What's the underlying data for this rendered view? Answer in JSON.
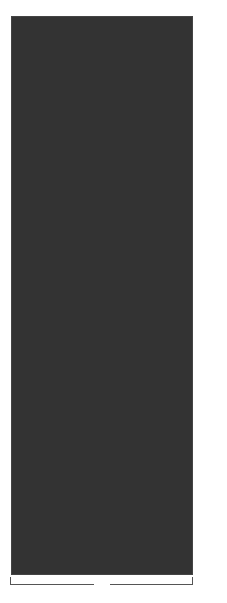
{
  "chart_data": {
    "type": "heatmap",
    "xlabel": "20-st rep",
    "ylabel": "",
    "columns": 20,
    "rows": 60,
    "row_labels": [
      {
        "row": 60,
        "label": "60"
      },
      {
        "row": 50,
        "label": "50"
      },
      {
        "row": 40,
        "label": "40"
      },
      {
        "row": 30,
        "label": "30"
      },
      {
        "row": 20,
        "label": "20"
      },
      {
        "row": 10,
        "label": "10"
      },
      {
        "row": 1,
        "label": "1"
      }
    ],
    "palette": {
      "D": "#5a5a5a",
      "L": "#e4e4e4",
      "G": "#b6b6b6",
      "M": "#8e8e8e",
      "K": "#6c6c6c",
      "C": "#c8c8c8"
    },
    "grid_top_to_bottom": [
      "DDDDDDDDDDDDDDDDDDDD",
      "LLLLLLLLLLLLLLLLLLLL",
      "LLLLDDDDLLLLLLDDDDLL",
      "LLLLLDDDDLLLLLLDDDDL",
      "LLLLLLDDDDLLLLLLDDDD",
      "LLDDDLLDDDDLLDDDLLDD",
      "DDLLLDLLLLDDLLLLDLLL",
      "DLLLLDDLLLLDLLLLDDLL",
      "LLDDDDLDDDDLLDDDDLDD",
      "LDDDDLLLLLLLDDDDLLLL",
      "DDDDLLLLLLDDDDLLLLLL",
      "DDDLLLLLLDDDDLLLLLLD",
      "LLLLLLLLLLLLLLLLLLLL",
      "DDDDDDDDDDDDDDDDDDDD",
      "DDDDDDDDDDDDDDDDDDDD",
      "GGGGGGGGGGGGGGGGGGGG",
      "DDDDDDDDDDDDDDDDDDDD",
      "GGGGGDDDDGGGDDDDGGGG",
      "DGGGDDDDDGDDDDDGGGDG",
      "GGGGDMMDDDDMMDGGGGGG",
      "GGGGDMMMMDMMMMDGGGGG",
      "GDDDDMMMMDMMMMDDDDGG",
      "GGMMMMGGMMMGGMMMMGGG",
      "GGGMMMGGGMGGGMMMGGGG",
      "GMMMMMMMGCGMMMMMMMGG",
      "GDDDDDDMCMCMDDDDDDDG",
      "GMMMMMMMGCGMMMMMMMGG",
      "GGGMMMGGGMGGGMMMGGGG",
      "GGMMMMGGMMMGGMMMMGGG",
      "GDDDDMMMMDMMMMDDDDGG",
      "GGGGDMMMMDMMMMDGGGGG",
      "GGGGDMMDDDDMMDGGGGGG",
      "DGGGDDDDDGDDDDDGGGDG",
      "GGGGGDDDDGGGDDDDGGGG",
      "DDDDDDDDDDDDDDDDDDDD",
      "GGGGGGGGGGGGGGGGGGGG",
      "DDDDDDDDDDDDDDDDDDDD",
      "LLLLLLLLLLLLLLLLLLLL",
      "LLLLDDDDLLLLLLDDDDLL",
      "LLLLLDDDDLLLLLLDDDDL",
      "LLLLLLDDDDLLLLLLDDDD",
      "DDDDDDLLLLDDDDDDLLLL",
      "LLDDDLLDDDDLLDDDLLDD",
      "DLLLLDDLLLLDLLLLDDLL",
      "DDLLLDLLLLDDLLLLDLLL",
      "LDDDDLLLLLLLDDDDLLLL",
      "DDDDLLLLLLDDDDLLLLLL",
      "DDDLLLLLLDDDDLLLLLLD",
      "LLLLLLLLLLLLLLLLLLLL",
      "DDDDDDDDDDDDDDDDDDDD",
      "DDDDDDDDDDDDDDDDDDDD",
      "DDDDDDDDDDDDDDDDDDDD",
      "KKKKKKKKKKKKKKKKKKKK",
      "KKKKKKKKKKKKKKKKKKKK",
      "CCKCCCCKCCCCKCCCCKCC",
      "CKCKCCKCKCCKCKCCKCKC",
      "KCKCKKCKCKKCKCKKCKCK",
      "KKKKKKKKKKKKKKKKKKKK",
      "KKKKKKKKKKKKKKKKKKKK",
      "KKKKKKKKKKKKKKKKKKKK"
    ]
  },
  "footer": {
    "repeat_label": "20-st rep"
  }
}
